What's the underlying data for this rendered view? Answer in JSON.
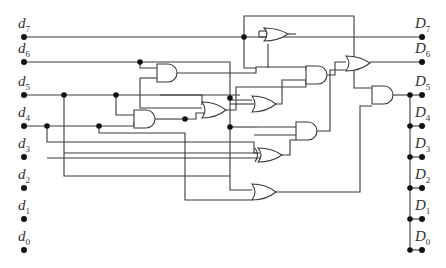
{
  "diagram": {
    "type": "logic-circuit",
    "inputs": [
      {
        "name": "d",
        "sub": "7",
        "y": 37
      },
      {
        "name": "d",
        "sub": "6",
        "y": 62
      },
      {
        "name": "d",
        "sub": "5",
        "y": 95
      },
      {
        "name": "d",
        "sub": "4",
        "y": 126
      },
      {
        "name": "d",
        "sub": "3",
        "y": 157
      },
      {
        "name": "d",
        "sub": "2",
        "y": 188
      },
      {
        "name": "d",
        "sub": "1",
        "y": 219
      },
      {
        "name": "d",
        "sub": "0",
        "y": 250
      }
    ],
    "outputs": [
      {
        "name": "D",
        "sub": "7",
        "y": 37
      },
      {
        "name": "D",
        "sub": "6",
        "y": 62
      },
      {
        "name": "D",
        "sub": "5",
        "y": 95
      },
      {
        "name": "D",
        "sub": "4",
        "y": 126
      },
      {
        "name": "D",
        "sub": "3",
        "y": 157
      },
      {
        "name": "D",
        "sub": "2",
        "y": 188
      },
      {
        "name": "D",
        "sub": "1",
        "y": 219
      },
      {
        "name": "D",
        "sub": "0",
        "y": 250
      }
    ],
    "gates": [
      "OR",
      "AND",
      "OR",
      "AND",
      "OR",
      "AND",
      "AND",
      "OR",
      "AND",
      "XOR",
      "OR"
    ],
    "colors": {
      "wire": "#3a3a3a",
      "dot": "#111111",
      "background": "#ffffff"
    }
  }
}
